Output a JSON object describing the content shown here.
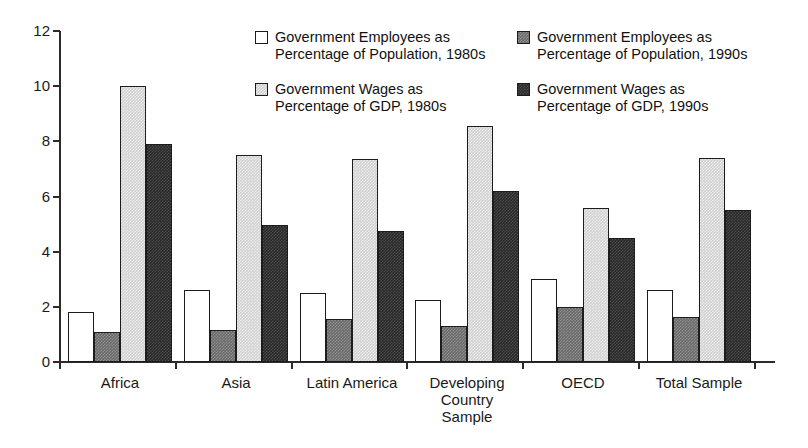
{
  "chart_data": {
    "type": "bar",
    "title": "",
    "xlabel": "",
    "ylabel": "",
    "ylim": [
      0,
      12
    ],
    "yticks": [
      "0",
      "2",
      "4",
      "6",
      "8",
      "10",
      "12"
    ],
    "grid": false,
    "legend_position": "top-right",
    "categories": [
      "Africa",
      "Asia",
      "Latin America",
      "Developing\nCountry\nSample",
      "OECD",
      "Total Sample"
    ],
    "series": [
      {
        "name": "Government Employees as\nPercentage of Population, 1980s",
        "color": "#ffffff",
        "values": [
          1.8,
          2.6,
          2.5,
          2.25,
          3.0,
          2.6
        ]
      },
      {
        "name": "Government Employees as\nPercentage of Population, 1990s",
        "color": "#6a6a6a",
        "values": [
          1.1,
          1.15,
          1.55,
          1.3,
          2.0,
          1.65
        ]
      },
      {
        "name": "Government Wages as\nPercentage of GDP, 1980s",
        "color": "#d2d2d2",
        "values": [
          10.0,
          7.5,
          7.35,
          8.55,
          5.6,
          7.4
        ]
      },
      {
        "name": "Government Wages as\nPercentage of GDP, 1990s",
        "color": "#2a2a2a",
        "values": [
          7.9,
          4.95,
          4.75,
          6.2,
          4.5,
          5.5
        ]
      }
    ]
  },
  "axis": {
    "tick_labels": [
      "0",
      "2",
      "4",
      "6",
      "8",
      "10",
      "12"
    ]
  },
  "legend": {
    "items": [
      {
        "label": "Government Employees as\nPercentage of Population, 1980s",
        "swatch": "s0"
      },
      {
        "label": "Government Employees as\nPercentage of Population, 1990s",
        "swatch": "s1"
      },
      {
        "label": "Government Wages as\nPercentage of GDP, 1980s",
        "swatch": "s2"
      },
      {
        "label": "Government Wages as\nPercentage of GDP, 1990s",
        "swatch": "s3"
      }
    ]
  }
}
